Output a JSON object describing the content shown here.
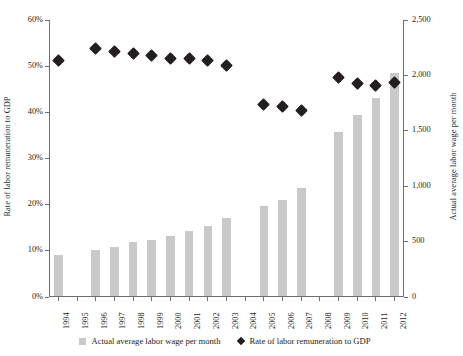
{
  "chart_data": {
    "type": "bar",
    "title": "",
    "xlabel": "",
    "categories": [
      "1994",
      "1995",
      "1996",
      "1997",
      "1998",
      "1999",
      "2000",
      "2001",
      "2002",
      "2003",
      "2004",
      "2005",
      "2006",
      "2007",
      "2008",
      "2009",
      "2010",
      "2011",
      "2012"
    ],
    "grid": false,
    "legend_position": "bottom",
    "axes": {
      "left": {
        "label": "Rate of labor remuneration to GDP",
        "ylim": [
          0,
          60
        ],
        "ticks": [
          0,
          10,
          20,
          30,
          40,
          50,
          60
        ],
        "tick_labels": [
          "0%",
          "10%",
          "20%",
          "30%",
          "40%",
          "50%",
          "60%"
        ],
        "unit": "percent"
      },
      "right": {
        "label": "Actual average labor wage per month",
        "ylim": [
          0,
          2500
        ],
        "ticks": [
          0,
          500,
          1000,
          1500,
          2000,
          2500
        ],
        "tick_labels": [
          "0",
          "500",
          "1,000",
          "1,500",
          "2,000",
          "2,500"
        ]
      }
    },
    "series": [
      {
        "name": "Actual average labor wage per month",
        "type": "bar",
        "axis": "right",
        "color": "#c9cac8",
        "values": [
          375,
          null,
          425,
          455,
          500,
          515,
          550,
          595,
          640,
          710,
          null,
          820,
          875,
          985,
          null,
          1490,
          1640,
          1800,
          2020
        ]
      },
      {
        "name": "Rate of labor remuneration to GDP",
        "type": "scatter",
        "axis": "left",
        "color": "#231f20",
        "marker": "diamond",
        "values": [
          51.3,
          null,
          53.8,
          53.2,
          52.7,
          52.3,
          51.7,
          51.7,
          51.2,
          50.1,
          null,
          41.8,
          41.2,
          40.3,
          null,
          47.5,
          46.2,
          45.8,
          46.5
        ]
      }
    ]
  },
  "legend": {
    "items": [
      {
        "label": "Actual average labor wage per month",
        "marker": "square"
      },
      {
        "label": "Rate of labor remuneration to GDP",
        "marker": "diamond"
      }
    ]
  }
}
